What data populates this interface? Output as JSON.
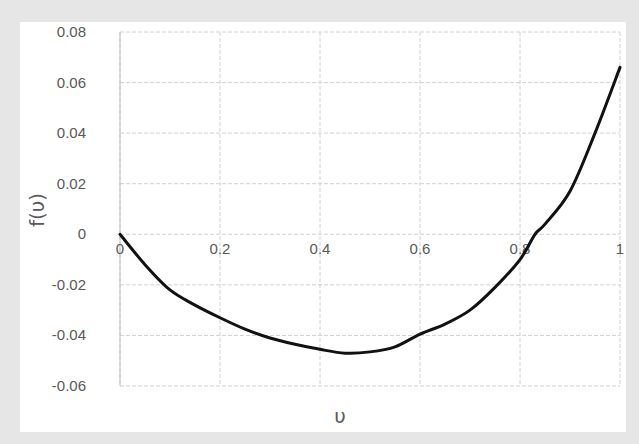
{
  "chart_data": {
    "type": "line",
    "title": "",
    "xlabel": "υ",
    "ylabel": "f(υ)",
    "xlim": [
      0,
      1
    ],
    "ylim": [
      -0.06,
      0.08
    ],
    "x_ticks": [
      "0",
      "0.2",
      "0.4",
      "0.6",
      "0.8",
      "1"
    ],
    "y_ticks": [
      "0.08",
      "0.06",
      "0.04",
      "0.02",
      "0",
      "-0.02",
      "-0.04",
      "-0.06"
    ],
    "grid": true,
    "legend": null,
    "series": [
      {
        "name": "f(υ)",
        "color": "#111111",
        "x": [
          0,
          0.05,
          0.1,
          0.15,
          0.2,
          0.25,
          0.3,
          0.35,
          0.4,
          0.45,
          0.5,
          0.55,
          0.6,
          0.65,
          0.7,
          0.75,
          0.8,
          0.83,
          0.85,
          0.9,
          0.95,
          1.0
        ],
        "values": [
          0,
          -0.012,
          -0.022,
          -0.028,
          -0.033,
          -0.0375,
          -0.041,
          -0.0435,
          -0.0455,
          -0.047,
          -0.0465,
          -0.0445,
          -0.0395,
          -0.0355,
          -0.03,
          -0.021,
          -0.01,
          0.0,
          0.004,
          0.017,
          0.04,
          0.066
        ]
      }
    ]
  }
}
